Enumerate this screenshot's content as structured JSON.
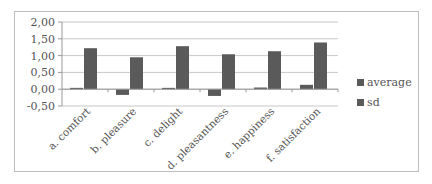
{
  "chart_data": {
    "type": "bar",
    "title": "",
    "xlabel": "",
    "ylabel": "",
    "ylim": [
      -0.5,
      2.0
    ],
    "yticks": [
      "2,00",
      "1,50",
      "1,00",
      "0,50",
      "0,00",
      "-0,50"
    ],
    "grid": true,
    "legend_position": "right",
    "categories": [
      "a. comfort",
      "b. pleasure",
      "c. delight",
      "d. pleasantness",
      "e. happiness",
      "f. satisfaction"
    ],
    "series": [
      {
        "name": "average",
        "color": "#5a5a5a",
        "values": [
          0.04,
          -0.17,
          0.04,
          -0.2,
          0.05,
          0.13
        ]
      },
      {
        "name": "sd",
        "color": "#5a5a5a",
        "values": [
          1.22,
          0.95,
          1.28,
          1.04,
          1.13,
          1.39
        ]
      }
    ]
  },
  "legend": {
    "items": [
      {
        "label": "average",
        "color": "#5a5a5a"
      },
      {
        "label": "sd",
        "color": "#5a5a5a"
      }
    ]
  }
}
